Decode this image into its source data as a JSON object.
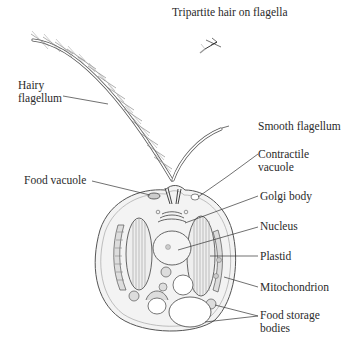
{
  "diagram": {
    "labels": {
      "tripartite_hair": "Tripartite hair on flagella",
      "hairy_flagellum": "Hairy\nflagellum",
      "smooth_flagellum": "Smooth flagellum",
      "contractile_vacuole": "Contractile\nvacuole",
      "food_vacuole": "Food vacuole",
      "golgi_body": "Golgi body",
      "nucleus": "Nucleus",
      "plastid": "Plastid",
      "mitochondrion": "Mitochondrion",
      "food_storage_bodies": "Food storage\nbodies"
    },
    "colors": {
      "line": "#444444",
      "cell_fill": "#f2f2f2",
      "organelle_fill": "#e6e6e6",
      "text": "#2a2a2a"
    }
  }
}
